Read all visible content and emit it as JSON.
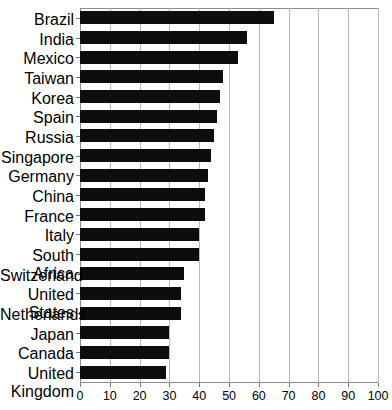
{
  "chart_data": {
    "type": "bar",
    "orientation": "horizontal",
    "title": "",
    "subtitle": "",
    "xlabel": "",
    "ylabel": "",
    "xlim": [
      0,
      100
    ],
    "xticks": [
      0,
      10,
      20,
      30,
      40,
      50,
      60,
      70,
      80,
      90,
      100
    ],
    "xtick_labels": [
      "0",
      "10",
      "20",
      "30",
      "40",
      "50",
      "60",
      "70",
      "80",
      "90",
      "100"
    ],
    "grid": "vertical",
    "legend": "none",
    "bar_color": "#0d0d0d",
    "categories": [
      "Brazil",
      "India",
      "Mexico",
      "Taiwan",
      "Korea",
      "Spain",
      "Russia",
      "Singapore",
      "Germany",
      "China",
      "France",
      "Italy",
      "South Africa",
      "Switzerland",
      "United States",
      "Netherlands",
      "Japan",
      "Canada",
      "United Kingdom"
    ],
    "values": [
      65,
      56,
      53,
      48,
      47,
      46,
      45,
      44,
      43,
      42,
      42,
      40,
      40,
      35,
      34,
      34,
      30,
      30,
      29
    ]
  }
}
